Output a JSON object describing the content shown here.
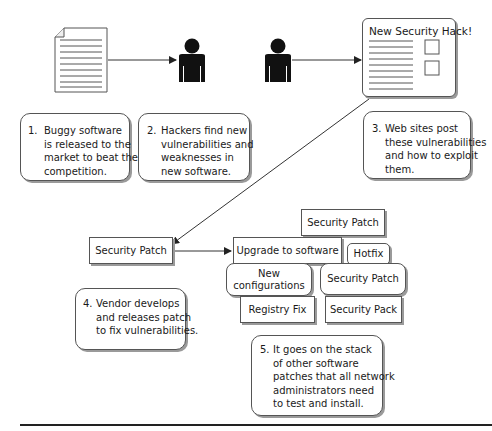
{
  "diagram": {
    "web_page": {
      "title": "New Security Hack!"
    },
    "steps": [
      {
        "number": "1.",
        "text": "Buggy software\nis released to the\nmarket to beat the\ncompetition."
      },
      {
        "number": "2.",
        "text": "Hackers find new\nvulnerabilities and\nweaknesses in\nnew software."
      },
      {
        "number": "3.",
        "text": "Web sites post\nthese vulnerabilities\nand how to exploit\nthem."
      },
      {
        "number": "4.",
        "text": "Vendor develops\nand releases patch\nto fix vulnerabilities."
      },
      {
        "number": "5.",
        "text": "It goes on the stack\nof other software\npatches that all network\nadministrators need\nto test and install."
      }
    ],
    "vendor_patch": "Security Patch",
    "patch_stack": {
      "top": "Security Patch",
      "upgrade": "Upgrade to software",
      "hotfix": "Hotfix",
      "new_configurations": "New\nconfigurations",
      "security_patch": "Security Patch",
      "registry_fix": "Registry Fix",
      "security_pack": "Security Pack"
    },
    "icons": [
      "document-icon",
      "hacker-person-icon",
      "hacker-person-icon",
      "web-page-icon"
    ],
    "colors": {
      "stroke": "#555555",
      "shadow": "#9a9a9a",
      "figure": "#111111"
    }
  }
}
